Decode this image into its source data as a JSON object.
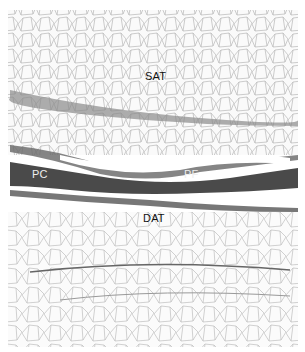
{
  "image": {
    "description": "Grayscale histology micrograph showing adipose tissue layers separated by fascia",
    "labels": {
      "sat": "SAT",
      "pc": "PC",
      "pf": "PF",
      "dat": "DAT"
    }
  }
}
